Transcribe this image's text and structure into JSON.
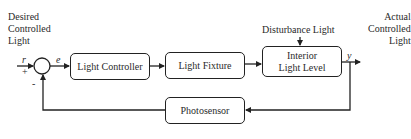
{
  "diagram": {
    "type": "block-diagram",
    "input_label": [
      "Desired",
      "Controlled",
      "Light"
    ],
    "output_label": [
      "Actual",
      "Controlled",
      "Light"
    ],
    "signals": {
      "reference": "r",
      "error": "e",
      "output": "y"
    },
    "signs": {
      "plus": "+",
      "minus": "-"
    },
    "disturbance": "Disturbance Light",
    "blocks": [
      {
        "id": "light-controller",
        "label": "Light Controller"
      },
      {
        "id": "light-fixture",
        "label": "Light Fixture"
      },
      {
        "id": "interior-light-level",
        "label_line1": "Interior",
        "label_line2": "Light Level"
      },
      {
        "id": "photosensor",
        "label": "Photosensor"
      }
    ],
    "connections": [
      [
        "input",
        "summing-junction"
      ],
      [
        "summing-junction",
        "light-controller"
      ],
      [
        "light-controller",
        "light-fixture"
      ],
      [
        "light-fixture",
        "interior-light-level"
      ],
      [
        "disturbance",
        "interior-light-level"
      ],
      [
        "interior-light-level",
        "output"
      ],
      [
        "output",
        "photosensor"
      ],
      [
        "photosensor",
        "summing-junction"
      ]
    ],
    "colors": {
      "line": "#222222",
      "text": "#2a2a2a",
      "background": "#ffffff"
    }
  }
}
